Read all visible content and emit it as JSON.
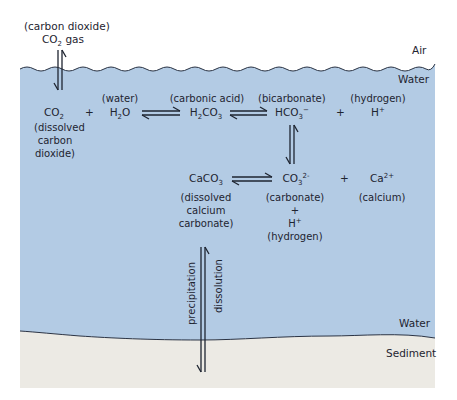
{
  "layers": {
    "air_label": "Air",
    "water_top_label": "Water",
    "water_bottom_label": "Water",
    "sediment_label": "Sediment"
  },
  "colors": {
    "water": "#b3cbe4",
    "sediment": "#eceae4",
    "outline": "#2a3344",
    "text": "#1e2430"
  },
  "gas": {
    "name": "(carbon dioxide)",
    "formula_main": "CO",
    "formula_sub": "2",
    "formula_tail": " gas"
  },
  "row1": {
    "co2": {
      "main": "CO",
      "sub": "2",
      "note_lines": [
        "(dissolved",
        "carbon",
        "dioxide)"
      ]
    },
    "plus1": "+",
    "h2o": {
      "name": "(water)",
      "p1": "H",
      "sub": "2",
      "p2": "O"
    },
    "h2co3": {
      "name": "(carbonic acid)",
      "p1": "H",
      "sub1": "2",
      "p2": "CO",
      "sub2": "3"
    },
    "hco3": {
      "name": "(bicarbonate)",
      "main": "HCO",
      "sub": "3",
      "sup": "−"
    },
    "plus2": "+",
    "h": {
      "name": "(hydrogen)",
      "main": "H",
      "sup": "+"
    }
  },
  "row2": {
    "caco3": {
      "main": "CaCO",
      "sub": "3",
      "note_lines": [
        "(dissolved",
        "calcium",
        "carbonate)"
      ]
    },
    "co3": {
      "main": "CO",
      "sub": "3",
      "sup": "2-",
      "note_lines": [
        "(carbonate)",
        "+"
      ],
      "h_main": "H",
      "h_sup": "+",
      "h_name": "(hydrogen)"
    },
    "plus": "+",
    "ca": {
      "main": "Ca",
      "sup": "2+",
      "name": "(calcium)"
    }
  },
  "vertical": {
    "left_label": "precipitation",
    "right_label": "dissolution"
  }
}
